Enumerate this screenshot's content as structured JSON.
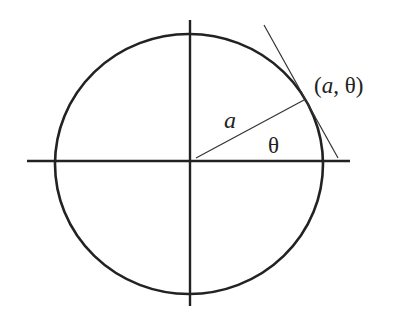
{
  "diagram": {
    "labels": {
      "point": "(a, θ)",
      "point_open": "(",
      "point_a": "a",
      "point_sep": ", ",
      "point_theta": "θ",
      "point_close": ")",
      "radius": "a",
      "angle": "θ"
    },
    "colors": {
      "stroke": "#222222",
      "background": "#ffffff"
    }
  }
}
